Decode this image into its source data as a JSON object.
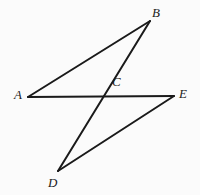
{
  "figure": {
    "background_color": "#fbfbfb",
    "stroke_color": "#1a1a1a",
    "stroke_width": 2,
    "width": 200,
    "height": 195,
    "points": {
      "A": {
        "label": "A",
        "x": 28,
        "y": 97
      },
      "B": {
        "label": "B",
        "x": 150,
        "y": 21
      },
      "C": {
        "label": "C",
        "x": 101,
        "y": 97
      },
      "D": {
        "label": "D",
        "x": 58,
        "y": 171
      },
      "E": {
        "label": "E",
        "x": 174,
        "y": 96
      }
    },
    "segments": [
      {
        "name": "segment-AB",
        "from": "A",
        "to": "B",
        "path": "M 28 97 L 150 21"
      },
      {
        "name": "segment-AE",
        "from": "A",
        "to": "E",
        "path": "M 28 97 L 174 96"
      },
      {
        "name": "segment-BD",
        "from": "B",
        "to": "D",
        "path": "M 150 21 L 58 171"
      },
      {
        "name": "segment-DE",
        "from": "D",
        "to": "E",
        "path": "M 58 171 L 174 96"
      }
    ]
  }
}
